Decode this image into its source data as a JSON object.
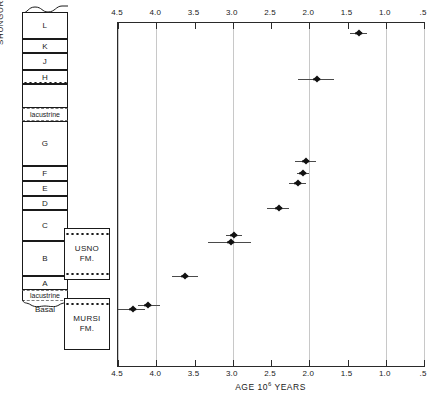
{
  "figure": {
    "axis_title_pre": "AGE 10",
    "axis_title_sup": "6",
    "axis_title_post": " YEARS"
  },
  "strat_column": {
    "formation_label": "SHUNGURA FORMATION",
    "basal_label": "Basal",
    "members": [
      {
        "label": "L",
        "kind": "member"
      },
      {
        "label": "K",
        "kind": "member"
      },
      {
        "label": "J",
        "kind": "member"
      },
      {
        "label": "H",
        "kind": "member"
      },
      {
        "label": "",
        "kind": "member"
      },
      {
        "label": "lacustrine",
        "kind": "lacustrine"
      },
      {
        "label": "G",
        "kind": "member"
      },
      {
        "label": "F",
        "kind": "member"
      },
      {
        "label": "E",
        "kind": "member"
      },
      {
        "label": "D",
        "kind": "member"
      },
      {
        "label": "C",
        "kind": "member"
      },
      {
        "label": "B",
        "kind": "member"
      },
      {
        "label": "A",
        "kind": "member"
      },
      {
        "label": "lacustrine",
        "kind": "lacustrine"
      }
    ]
  },
  "side_formations": [
    {
      "name_line1": "USNO",
      "name_line2": "FM."
    },
    {
      "name_line1": "MURSI",
      "name_line2": "FM."
    }
  ],
  "chart_data": {
    "type": "scatter",
    "title": "",
    "xlabel": "AGE 10^6 YEARS",
    "ylabel": "",
    "xlim": [
      4.5,
      0.5
    ],
    "x_reversed": true,
    "grid": true,
    "legend": "none",
    "xticks": [
      4.5,
      4.0,
      3.5,
      3.0,
      2.5,
      2.0,
      1.5,
      1.0,
      0.5
    ],
    "xticklabels": [
      "4.5",
      "4.0",
      "3.5",
      "3.0",
      "2.5",
      "2.0",
      "1.5",
      "1.0",
      ".5"
    ],
    "gridline_values": [
      4.5,
      4.0,
      3.0,
      2.0,
      1.0,
      0.5
    ],
    "points": [
      {
        "age": 1.35,
        "err_low": 1.47,
        "err_high": 1.24,
        "row": 1
      },
      {
        "age": 1.9,
        "err_low": 2.15,
        "err_high": 1.67,
        "row": 2
      },
      {
        "age": 2.04,
        "err_low": 2.18,
        "err_high": 1.91,
        "row": 3
      },
      {
        "age": 2.08,
        "err_low": 2.16,
        "err_high": 2.0,
        "row": 4
      },
      {
        "age": 2.15,
        "err_low": 2.26,
        "err_high": 2.04,
        "row": 5
      },
      {
        "age": 2.39,
        "err_low": 2.55,
        "err_high": 2.27,
        "row": 6
      },
      {
        "age": 2.98,
        "err_low": 3.09,
        "err_high": 2.88,
        "row": 7
      },
      {
        "age": 3.02,
        "err_low": 3.33,
        "err_high": 2.76,
        "row": 8
      },
      {
        "age": 3.62,
        "err_low": 3.79,
        "err_high": 3.46,
        "row": 9
      },
      {
        "age": 4.11,
        "err_low": 4.24,
        "err_high": 3.95,
        "row": 10
      },
      {
        "age": 4.3,
        "err_low": 4.5,
        "err_high": 4.15,
        "row": 11
      }
    ]
  }
}
